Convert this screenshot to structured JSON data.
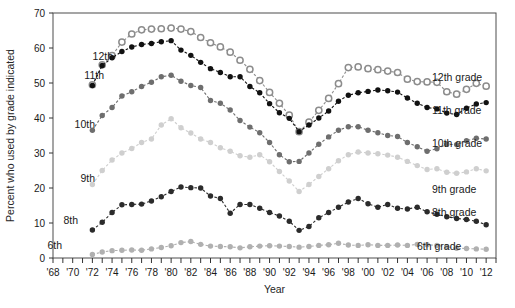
{
  "chart_data": {
    "type": "line",
    "title": "",
    "xlabel": "Year",
    "ylabel": "Percent who used by grade indicated",
    "xlim": [
      1968,
      2013
    ],
    "ylim": [
      0,
      70
    ],
    "grid": false,
    "legend_position": "right",
    "y_ticks": [
      0,
      10,
      20,
      30,
      40,
      50,
      60,
      70
    ],
    "x_tick_labels": [
      "'68",
      "'70",
      "'72",
      "'74",
      "'76",
      "'78",
      "'80",
      "'82",
      "'84",
      "'86",
      "'88",
      "'90",
      "'92",
      "'94",
      "'96",
      "'98",
      "'00",
      "'02",
      "'04",
      "'06",
      "'08",
      "'10",
      "'12"
    ],
    "x_tick_years": [
      1968,
      1970,
      1972,
      1974,
      1976,
      1978,
      1980,
      1982,
      1984,
      1986,
      1988,
      1990,
      1992,
      1994,
      1996,
      1998,
      2000,
      2002,
      2004,
      2006,
      2008,
      2010,
      2012
    ],
    "x_minor_years": [
      1969,
      1971,
      1973,
      1975,
      1977,
      1979,
      1981,
      1983,
      1985,
      1987,
      1989,
      1991,
      1993,
      1995,
      1997,
      1999,
      2001,
      2003,
      2005,
      2007,
      2009,
      2011,
      2013
    ],
    "series": [
      {
        "name": "12th grade",
        "inline_label": "12th",
        "legend_label": "12th grade",
        "color": "#8c8c8c",
        "marker": "open-circle",
        "x": [
          1972,
          1973,
          1974,
          1975,
          1976,
          1977,
          1978,
          1979,
          1980,
          1981,
          1982,
          1983,
          1984,
          1985,
          1986,
          1987,
          1988,
          1989,
          1990,
          1991,
          1992,
          1993,
          1994,
          1995,
          1996,
          1997,
          1998,
          1999,
          2000,
          2001,
          2002,
          2003,
          2004,
          2005,
          2006,
          2007,
          2008,
          2009,
          2010,
          2011,
          2012
        ],
        "y": [
          49.5,
          55.2,
          57.8,
          61.7,
          64.0,
          65.2,
          65.4,
          65.5,
          65.7,
          65.4,
          64.7,
          63.0,
          61.5,
          60.3,
          58.8,
          56.5,
          53.9,
          50.7,
          47.3,
          44.2,
          40.8,
          36.1,
          38.8,
          42.2,
          45.6,
          49.8,
          54.4,
          54.6,
          54.1,
          53.8,
          53.4,
          53.0,
          51.1,
          50.4,
          50.3,
          50.2,
          47.5,
          46.8,
          48.2,
          49.9,
          49.1
        ]
      },
      {
        "name": "11th grade",
        "inline_label": "11th",
        "legend_label": "11th grade",
        "color": "#111111",
        "marker": "filled-circle",
        "x": [
          1972,
          1973,
          1974,
          1975,
          1976,
          1977,
          1978,
          1979,
          1980,
          1981,
          1982,
          1983,
          1984,
          1985,
          1986,
          1987,
          1988,
          1989,
          1990,
          1991,
          1992,
          1993,
          1994,
          1995,
          1996,
          1997,
          1998,
          1999,
          2000,
          2001,
          2002,
          2003,
          2004,
          2005,
          2006,
          2007,
          2008,
          2009,
          2010,
          2011,
          2012
        ],
        "y": [
          49.3,
          55.0,
          57.2,
          59.0,
          60.3,
          61.0,
          61.3,
          61.8,
          62.1,
          59.4,
          57.9,
          55.9,
          54.1,
          53.0,
          51.8,
          51.8,
          49.0,
          47.2,
          44.1,
          41.5,
          39.9,
          36.1,
          38.0,
          40.0,
          42.0,
          44.8,
          46.5,
          47.2,
          47.6,
          48.0,
          47.8,
          47.4,
          45.7,
          44.2,
          43.0,
          42.6,
          41.4,
          41.0,
          42.8,
          44.0,
          44.4
        ]
      },
      {
        "name": "10th grade",
        "inline_label": "10th",
        "legend_label": "10th grade",
        "color": "#6e6e6e",
        "marker": "filled-circle",
        "x": [
          1972,
          1973,
          1974,
          1975,
          1976,
          1977,
          1978,
          1979,
          1980,
          1981,
          1982,
          1983,
          1984,
          1985,
          1986,
          1987,
          1988,
          1989,
          1990,
          1991,
          1992,
          1993,
          1994,
          1995,
          1996,
          1997,
          1998,
          1999,
          2000,
          2001,
          2002,
          2003,
          2004,
          2005,
          2006,
          2007,
          2008,
          2009,
          2010,
          2011,
          2012
        ],
        "y": [
          36.5,
          40.7,
          43.0,
          46.3,
          47.5,
          49.0,
          50.2,
          51.8,
          52.2,
          50.5,
          49.3,
          48.7,
          45.0,
          44.2,
          42.3,
          39.3,
          37.4,
          35.8,
          33.0,
          29.5,
          27.5,
          27.6,
          30.0,
          32.5,
          34.6,
          36.5,
          37.5,
          37.5,
          36.5,
          35.8,
          35.0,
          34.7,
          33.0,
          31.8,
          30.5,
          31.2,
          32.5,
          32.4,
          33.5,
          34.2,
          34.0
        ]
      },
      {
        "name": "9th grade",
        "inline_label": "9th",
        "legend_label": "9th grade",
        "color": "#cfcfcf",
        "marker": "filled-circle",
        "x": [
          1972,
          1973,
          1974,
          1975,
          1976,
          1977,
          1978,
          1979,
          1980,
          1981,
          1982,
          1983,
          1984,
          1985,
          1986,
          1987,
          1988,
          1989,
          1990,
          1991,
          1992,
          1993,
          1994,
          1995,
          1996,
          1997,
          1998,
          1999,
          2000,
          2001,
          2002,
          2003,
          2004,
          2005,
          2006,
          2007,
          2008,
          2009,
          2010,
          2011,
          2012
        ],
        "y": [
          21.0,
          25.0,
          28.0,
          30.0,
          31.3,
          33.0,
          34.0,
          38.0,
          39.8,
          37.2,
          35.7,
          34.0,
          33.0,
          31.5,
          30.5,
          29.2,
          28.8,
          29.5,
          27.5,
          24.7,
          22.0,
          19.0,
          21.0,
          23.3,
          25.5,
          27.8,
          29.5,
          30.3,
          30.0,
          29.8,
          29.4,
          28.8,
          27.6,
          26.4,
          25.3,
          25.5,
          24.5,
          24.2,
          24.6,
          25.5,
          24.9
        ]
      },
      {
        "name": "8th grade",
        "inline_label": "8th",
        "legend_label": "8th grade",
        "color": "#2b2b2b",
        "marker": "filled-circle",
        "x": [
          1972,
          1973,
          1974,
          1975,
          1976,
          1977,
          1978,
          1979,
          1980,
          1981,
          1982,
          1983,
          1984,
          1985,
          1986,
          1987,
          1988,
          1989,
          1990,
          1991,
          1992,
          1993,
          1994,
          1995,
          1996,
          1997,
          1998,
          1999,
          2000,
          2001,
          2002,
          2003,
          2004,
          2005,
          2006,
          2007,
          2008,
          2009,
          2010,
          2011,
          2012
        ],
        "y": [
          8.0,
          10.2,
          13.0,
          15.2,
          15.3,
          15.4,
          16.3,
          17.5,
          19.0,
          20.3,
          20.1,
          20.0,
          17.7,
          17.0,
          12.8,
          15.3,
          15.3,
          14.2,
          13.0,
          12.0,
          10.5,
          7.9,
          9.0,
          11.5,
          13.0,
          14.5,
          16.0,
          17.0,
          15.5,
          14.5,
          15.3,
          14.2,
          14.0,
          14.5,
          13.2,
          12.5,
          11.8,
          11.3,
          11.0,
          10.5,
          9.5
        ]
      },
      {
        "name": "6th grade",
        "inline_label": "6th",
        "legend_label": "6th grade",
        "color": "#b0b0b0",
        "marker": "filled-circle",
        "x": [
          1972,
          1973,
          1974,
          1975,
          1976,
          1977,
          1978,
          1979,
          1980,
          1981,
          1982,
          1983,
          1984,
          1985,
          1986,
          1987,
          1988,
          1989,
          1990,
          1991,
          1992,
          1993,
          1994,
          1995,
          1996,
          1997,
          1998,
          1999,
          2000,
          2001,
          2002,
          2003,
          2004,
          2005,
          2006,
          2007,
          2008,
          2009,
          2010,
          2011,
          2012
        ],
        "y": [
          1.0,
          1.7,
          2.1,
          2.2,
          2.3,
          2.2,
          2.6,
          3.0,
          3.5,
          4.4,
          4.7,
          3.9,
          3.4,
          3.3,
          3.2,
          2.9,
          3.2,
          3.4,
          3.5,
          3.4,
          3.3,
          3.1,
          3.3,
          3.6,
          3.8,
          4.2,
          3.7,
          3.6,
          3.8,
          3.6,
          3.6,
          3.7,
          3.6,
          3.9,
          3.8,
          3.6,
          3.2,
          2.8,
          2.7,
          2.6,
          2.5
        ]
      }
    ]
  }
}
